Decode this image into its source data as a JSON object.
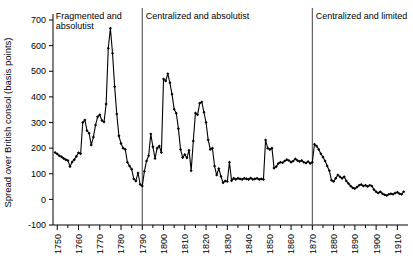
{
  "chart_data": {
    "type": "line",
    "title": "",
    "xlabel": "",
    "ylabel": "Spread over British consol (basis points)",
    "xlim": [
      1748,
      1915
    ],
    "ylim": [
      -100,
      700
    ],
    "yticks": [
      -100,
      0,
      100,
      200,
      300,
      400,
      500,
      600,
      700
    ],
    "xticks": [
      1750,
      1760,
      1770,
      1780,
      1790,
      1800,
      1810,
      1820,
      1830,
      1840,
      1850,
      1860,
      1870,
      1880,
      1890,
      1900,
      1910
    ],
    "minor_xtick_interval": 5,
    "grid": false,
    "legend": null,
    "markers": "filled-diamond",
    "annotations": [
      {
        "text": "Fragmented and absolutist",
        "x_start": 1748,
        "x_end": 1790
      },
      {
        "text": "Centralized and absolutist",
        "x_start": 1790,
        "x_end": 1870
      },
      {
        "text": "Centralized and limited",
        "x_start": 1870,
        "x_end": 1915
      }
    ],
    "dividers": [
      1790,
      1870
    ],
    "series": [
      {
        "name": "Spread over British consol",
        "points": [
          [
            1749,
            183
          ],
          [
            1750,
            177
          ],
          [
            1751,
            170
          ],
          [
            1752,
            166
          ],
          [
            1753,
            160
          ],
          [
            1754,
            155
          ],
          [
            1755,
            152
          ],
          [
            1756,
            128
          ],
          [
            1757,
            146
          ],
          [
            1758,
            155
          ],
          [
            1759,
            168
          ],
          [
            1760,
            182
          ],
          [
            1761,
            178
          ],
          [
            1762,
            300
          ],
          [
            1763,
            310
          ],
          [
            1764,
            268
          ],
          [
            1765,
            258
          ],
          [
            1766,
            212
          ],
          [
            1767,
            243
          ],
          [
            1768,
            290
          ],
          [
            1769,
            322
          ],
          [
            1770,
            330
          ],
          [
            1771,
            308
          ],
          [
            1772,
            302
          ],
          [
            1773,
            372
          ],
          [
            1774,
            590
          ],
          [
            1775,
            668
          ],
          [
            1776,
            570
          ],
          [
            1777,
            440
          ],
          [
            1778,
            333
          ],
          [
            1779,
            248
          ],
          [
            1780,
            218
          ],
          [
            1781,
            200
          ],
          [
            1782,
            195
          ],
          [
            1783,
            145
          ],
          [
            1784,
            130
          ],
          [
            1785,
            118
          ],
          [
            1786,
            80
          ],
          [
            1787,
            72
          ],
          [
            1788,
            103
          ],
          [
            1789,
            58
          ],
          [
            1790,
            52
          ],
          [
            1791,
            110
          ],
          [
            1792,
            150
          ],
          [
            1793,
            170
          ],
          [
            1794,
            255
          ],
          [
            1795,
            205
          ],
          [
            1796,
            160
          ],
          [
            1797,
            200
          ],
          [
            1798,
            208
          ],
          [
            1799,
            183
          ],
          [
            1800,
            470
          ],
          [
            1801,
            462
          ],
          [
            1802,
            490
          ],
          [
            1803,
            455
          ],
          [
            1804,
            410
          ],
          [
            1805,
            352
          ],
          [
            1806,
            336
          ],
          [
            1807,
            276
          ],
          [
            1808,
            195
          ],
          [
            1809,
            163
          ],
          [
            1810,
            175
          ],
          [
            1811,
            162
          ],
          [
            1812,
            192
          ],
          [
            1813,
            112
          ],
          [
            1814,
            228
          ],
          [
            1815,
            337
          ],
          [
            1816,
            330
          ],
          [
            1817,
            375
          ],
          [
            1818,
            380
          ],
          [
            1819,
            340
          ],
          [
            1820,
            300
          ],
          [
            1821,
            232
          ],
          [
            1822,
            195
          ],
          [
            1823,
            200
          ],
          [
            1824,
            130
          ],
          [
            1825,
            95
          ],
          [
            1826,
            120
          ],
          [
            1827,
            90
          ],
          [
            1828,
            65
          ],
          [
            1829,
            72
          ],
          [
            1830,
            70
          ],
          [
            1831,
            145
          ],
          [
            1832,
            73
          ],
          [
            1833,
            82
          ],
          [
            1834,
            78
          ],
          [
            1835,
            82
          ],
          [
            1836,
            80
          ],
          [
            1837,
            78
          ],
          [
            1838,
            82
          ],
          [
            1839,
            80
          ],
          [
            1840,
            78
          ],
          [
            1841,
            83
          ],
          [
            1842,
            78
          ],
          [
            1843,
            80
          ],
          [
            1844,
            82
          ],
          [
            1845,
            78
          ],
          [
            1846,
            80
          ],
          [
            1847,
            78
          ],
          [
            1848,
            232
          ],
          [
            1849,
            200
          ],
          [
            1850,
            195
          ],
          [
            1851,
            200
          ],
          [
            1852,
            122
          ],
          [
            1853,
            128
          ],
          [
            1854,
            140
          ],
          [
            1855,
            145
          ],
          [
            1856,
            143
          ],
          [
            1857,
            150
          ],
          [
            1858,
            155
          ],
          [
            1859,
            152
          ],
          [
            1860,
            145
          ],
          [
            1861,
            150
          ],
          [
            1862,
            158
          ],
          [
            1863,
            152
          ],
          [
            1864,
            148
          ],
          [
            1865,
            152
          ],
          [
            1866,
            145
          ],
          [
            1867,
            142
          ],
          [
            1868,
            148
          ],
          [
            1869,
            140
          ],
          [
            1870,
            145
          ],
          [
            1871,
            215
          ],
          [
            1872,
            208
          ],
          [
            1873,
            195
          ],
          [
            1874,
            178
          ],
          [
            1875,
            165
          ],
          [
            1876,
            150
          ],
          [
            1877,
            130
          ],
          [
            1878,
            112
          ],
          [
            1879,
            75
          ],
          [
            1880,
            70
          ],
          [
            1881,
            82
          ],
          [
            1882,
            95
          ],
          [
            1883,
            88
          ],
          [
            1884,
            82
          ],
          [
            1885,
            88
          ],
          [
            1886,
            72
          ],
          [
            1887,
            62
          ],
          [
            1888,
            52
          ],
          [
            1889,
            45
          ],
          [
            1890,
            42
          ],
          [
            1891,
            48
          ],
          [
            1892,
            55
          ],
          [
            1893,
            58
          ],
          [
            1894,
            52
          ],
          [
            1895,
            55
          ],
          [
            1896,
            50
          ],
          [
            1897,
            55
          ],
          [
            1898,
            52
          ],
          [
            1899,
            38
          ],
          [
            1900,
            30
          ],
          [
            1901,
            25
          ],
          [
            1902,
            30
          ],
          [
            1903,
            22
          ],
          [
            1904,
            18
          ],
          [
            1905,
            15
          ],
          [
            1906,
            20
          ],
          [
            1907,
            22
          ],
          [
            1908,
            20
          ],
          [
            1909,
            25
          ],
          [
            1910,
            28
          ],
          [
            1911,
            22
          ],
          [
            1912,
            20
          ],
          [
            1913,
            30
          ]
        ]
      }
    ]
  }
}
